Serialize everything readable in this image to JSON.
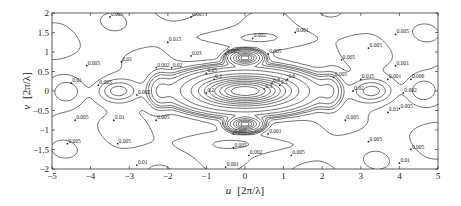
{
  "chart_data": {
    "type": "contour",
    "title": "",
    "xlabel": "u  [2π/λ]",
    "ylabel": "v  [2π/λ]",
    "xlim": [
      -5,
      5
    ],
    "ylim": [
      -2,
      2
    ],
    "xticks": [
      -5,
      -4,
      -3,
      -2,
      -1,
      0,
      1,
      2,
      3,
      4,
      5
    ],
    "yticks": [
      -2,
      -1.5,
      -1,
      -0.5,
      0,
      0.5,
      1,
      1.5,
      2
    ],
    "grid": false,
    "contour_levels": [
      0.001,
      0.002,
      0.005,
      0.01,
      0.015,
      0.02,
      0.03,
      0.05,
      0.1,
      0.2,
      0.3,
      0.4,
      0.5,
      0.6,
      0.7,
      0.8,
      0.9
    ],
    "features": [
      {
        "name": "main lobe",
        "center": [
          0,
          0
        ],
        "peak": "0.9",
        "shape": "horizontal ellipse"
      },
      {
        "name": "dense lobes",
        "centers": [
          [
            0,
            0.85
          ],
          [
            0,
            -0.85
          ]
        ]
      },
      {
        "name": "side lobes",
        "centers": [
          [
            -2.2,
            0
          ],
          [
            2.2,
            0
          ],
          [
            -4.3,
            0
          ],
          [
            4.3,
            0
          ]
        ]
      },
      {
        "name": "secondary lobes",
        "centers": [
          [
            -3.3,
            0
          ],
          [
            3.3,
            0
          ]
        ]
      }
    ],
    "labels": [
      {
        "text": "0.005",
        "u": -3.5,
        "v": 1.9
      },
      {
        "text": "0.005",
        "u": -1.4,
        "v": 1.9
      },
      {
        "text": "0.015",
        "u": -2.0,
        "v": 1.25
      },
      {
        "text": "0.002",
        "u": 0.2,
        "v": 1.35
      },
      {
        "text": "0.001",
        "u": 1.3,
        "v": 1.5
      },
      {
        "text": "0.03",
        "u": -1.4,
        "v": 0.9
      },
      {
        "text": "0.005",
        "u": -0.5,
        "v": 0.95
      },
      {
        "text": "0.005",
        "u": 0.6,
        "v": 0.95
      },
      {
        "text": "0.02",
        "u": -1.9,
        "v": 0.6
      },
      {
        "text": "0.05",
        "u": -1.0,
        "v": 0.45
      },
      {
        "text": "0.1",
        "u": -0.8,
        "v": 0.3
      },
      {
        "text": "0.2",
        "u": -1.0,
        "v": -0.05
      },
      {
        "text": "0.3",
        "u": 0.5,
        "v": 0.05
      },
      {
        "text": "0.5",
        "u": 0.9,
        "v": 0.15
      },
      {
        "text": "0.6",
        "u": 1.1,
        "v": 0.3
      },
      {
        "text": "0.8",
        "u": 0.7,
        "v": 0.2
      },
      {
        "text": "0.002",
        "u": -0.3,
        "v": -1.1
      },
      {
        "text": "0.001",
        "u": 0.6,
        "v": -1.1
      },
      {
        "text": "0.005",
        "u": -0.3,
        "v": -1.45
      },
      {
        "text": "0.002",
        "u": 0.1,
        "v": -1.65
      },
      {
        "text": "0.005",
        "u": 1.2,
        "v": -1.65
      },
      {
        "text": "0.001",
        "u": -0.5,
        "v": -1.95
      },
      {
        "text": "0.01",
        "u": -2.8,
        "v": -1.9
      },
      {
        "text": "0.005",
        "u": -4.1,
        "v": 0.65
      },
      {
        "text": "0.01",
        "u": -3.2,
        "v": 0.75
      },
      {
        "text": "0.005",
        "u": -3.8,
        "v": 0.15
      },
      {
        "text": "0.002",
        "u": -2.3,
        "v": 0.6
      },
      {
        "text": "0.01",
        "u": -4.5,
        "v": 0.2
      },
      {
        "text": "0.005",
        "u": -4.4,
        "v": -0.75
      },
      {
        "text": "0.01",
        "u": -3.4,
        "v": -0.75
      },
      {
        "text": "0.005",
        "u": -2.3,
        "v": -0.75
      },
      {
        "text": "0.005",
        "u": -4.6,
        "v": -1.35
      },
      {
        "text": "0.005",
        "u": -3.3,
        "v": -1.35
      },
      {
        "text": "0.002",
        "u": -2.8,
        "v": -0.1
      },
      {
        "text": "0.005",
        "u": 3.9,
        "v": 1.45
      },
      {
        "text": "0.005",
        "u": 3.2,
        "v": 1.1
      },
      {
        "text": "0.005",
        "u": 2.5,
        "v": 0.8
      },
      {
        "text": "0.001",
        "u": 3.9,
        "v": 0.65
      },
      {
        "text": "0.005",
        "u": 2.3,
        "v": 0.35
      },
      {
        "text": "0.015",
        "u": 3.0,
        "v": 0.3
      },
      {
        "text": "0.001",
        "u": 3.7,
        "v": 0.3
      },
      {
        "text": "0.006",
        "u": 4.3,
        "v": 0.3
      },
      {
        "text": "0.02",
        "u": 2.8,
        "v": 0.0
      },
      {
        "text": "0.002",
        "u": 4.1,
        "v": -0.05
      },
      {
        "text": "0.005",
        "u": 4.0,
        "v": -0.45
      },
      {
        "text": "0.01",
        "u": 3.7,
        "v": -0.55
      },
      {
        "text": "0.005",
        "u": 2.6,
        "v": -0.75
      },
      {
        "text": "0.005",
        "u": 3.2,
        "v": -1.3
      },
      {
        "text": "0.005",
        "u": 4.3,
        "v": -1.5
      },
      {
        "text": "0.01",
        "u": 4.0,
        "v": -1.85
      }
    ]
  },
  "axes": {
    "x_tick_labels": [
      "−5",
      "−4",
      "−3",
      "−2",
      "−1",
      "0",
      "1",
      "2",
      "3",
      "4",
      "5"
    ],
    "y_tick_labels": [
      "2",
      "1.5",
      "1",
      "0.5",
      "0",
      "−0.5",
      "−1",
      "−1.5",
      "−2"
    ],
    "xlabel_var": "u",
    "xlabel_unit": "[2π/λ]",
    "ylabel_var": "v",
    "ylabel_unit": "[2π/λ]"
  }
}
